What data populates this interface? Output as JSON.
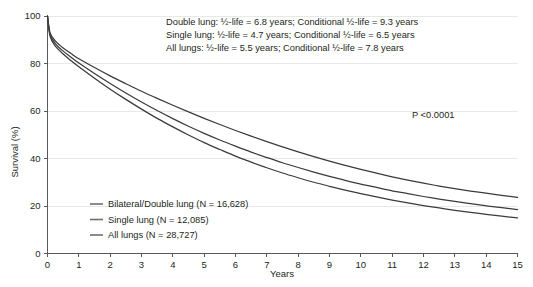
{
  "chart_data": {
    "type": "line",
    "title": "",
    "xlabel": "Years",
    "ylabel": "Survival (%)",
    "xlim": [
      0,
      15
    ],
    "ylim": [
      0,
      100
    ],
    "xticks": [
      "0",
      "1",
      "2",
      "3",
      "4",
      "5",
      "6",
      "7",
      "8",
      "9",
      "10",
      "11",
      "12",
      "13",
      "14",
      "15"
    ],
    "yticks": [
      "0",
      "20",
      "40",
      "60",
      "80",
      "100"
    ],
    "grid": true,
    "legend_position": "lower-left",
    "x": [
      0,
      0.08,
      0.25,
      0.5,
      0.75,
      1,
      1.5,
      2,
      2.5,
      3,
      3.5,
      4,
      4.5,
      5,
      5.5,
      6,
      6.5,
      7,
      7.5,
      8,
      8.5,
      9,
      9.5,
      10,
      10.5,
      11,
      11.5,
      12,
      12.5,
      13,
      13.5,
      14,
      14.5,
      15
    ],
    "series": [
      {
        "name": "Bilateral/Double lung",
        "n_label": "Bilateral/Double lung (N = 16,628)",
        "n": "16,628",
        "color": "#3b3b3b",
        "half_life": "6.8",
        "conditional_half_life": "9.3",
        "values": [
          100,
          93,
          89.5,
          86.5,
          84.2,
          82.0,
          78.3,
          74.8,
          71.5,
          68.3,
          65.3,
          62.4,
          59.6,
          56.9,
          54.3,
          51.8,
          49.4,
          47.1,
          44.9,
          42.8,
          40.8,
          38.9,
          37.1,
          35.4,
          33.8,
          32.3,
          30.9,
          29.6,
          28.4,
          27.3,
          26.3,
          25.4,
          24.5,
          23.6
        ]
      },
      {
        "name": "All lungs",
        "n_label": "All lungs (N = 28,727)",
        "n": "28,727",
        "color": "#3b3b3b",
        "half_life": "5.5",
        "conditional_half_life": "7.8",
        "values": [
          100,
          92.3,
          88.4,
          85.2,
          82.6,
          80.2,
          75.8,
          71.6,
          67.6,
          63.8,
          60.2,
          56.8,
          53.6,
          50.6,
          47.8,
          45.2,
          42.7,
          40.4,
          38.2,
          36.2,
          34.3,
          32.5,
          30.8,
          29.2,
          27.8,
          26.4,
          25.2,
          24.0,
          22.9,
          21.9,
          21.0,
          20.1,
          19.3,
          18.5
        ]
      },
      {
        "name": "Single lung",
        "n_label": "Single lung (N = 12,085)",
        "n": "12,085",
        "color": "#3b3b3b",
        "half_life": "4.7",
        "conditional_half_life": "6.5",
        "values": [
          100,
          91.5,
          87.3,
          84.0,
          81.2,
          78.6,
          73.8,
          69.2,
          64.9,
          60.8,
          56.9,
          53.3,
          49.9,
          46.7,
          43.8,
          41.0,
          38.5,
          36.1,
          33.9,
          31.9,
          30.0,
          28.3,
          26.7,
          25.2,
          23.8,
          22.5,
          21.3,
          20.2,
          19.2,
          18.2,
          17.3,
          16.5,
          15.7,
          15.0
        ]
      }
    ],
    "annotations": {
      "lines": [
        "Double lung: ½-life = 6.8 years; Conditional ½-life = 9.3 years",
        "Single lung: ½-life = 4.7 years; Conditional ½-life = 6.5 years",
        "All lungs: ½-life = 5.5 years; Conditional ½-life = 7.8 years"
      ],
      "pvalue": "P <0.0001"
    },
    "legend": [
      "Bilateral/Double lung (N = 16,628)",
      "Single lung (N = 12,085)",
      "All lungs (N = 28,727)"
    ]
  }
}
